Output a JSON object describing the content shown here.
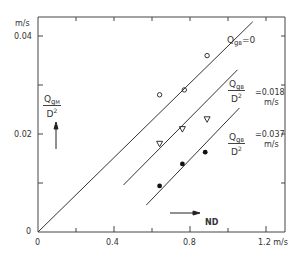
{
  "chart_data": {
    "type": "scatter",
    "title": "",
    "xlabel": "ND",
    "xunit": "m/s",
    "ylabel": "Q_gM / D^2",
    "yunit": "m/s",
    "xlim": [
      0,
      1.3
    ],
    "ylim": [
      0,
      0.044
    ],
    "x_ticks": [
      0,
      0.2,
      0.4,
      0.6,
      0.8,
      1.0,
      1.2
    ],
    "x_tick_labels": [
      "0",
      "",
      "0.4",
      "",
      "0.8",
      "",
      "1.2 m/s"
    ],
    "y_ticks": [
      0,
      0.01,
      0.02,
      0.03,
      0.04
    ],
    "y_tick_labels": [
      "0",
      "",
      "0.02",
      "",
      "0.04"
    ],
    "y_unit_label": "m/s",
    "grid": false,
    "series": [
      {
        "name": "Q_gB = 0",
        "marker": "open-circle",
        "points": [
          [
            0.64,
            0.028
          ],
          [
            0.77,
            0.029
          ],
          [
            0.89,
            0.036
          ]
        ],
        "fit_line": [
          [
            0.0,
            0.0
          ],
          [
            1.13,
            0.0429
          ]
        ]
      },
      {
        "name": "Q_gB / D^2 = 0.018 m/s",
        "marker": "open-triangle-down",
        "points": [
          [
            0.64,
            0.018
          ],
          [
            0.76,
            0.021
          ],
          [
            0.89,
            0.023
          ]
        ],
        "fit_line": [
          [
            0.45,
            0.0096
          ],
          [
            1.05,
            0.0331
          ]
        ]
      },
      {
        "name": "Q_gB / D^2 = 0.037 m/s",
        "marker": "filled-circle",
        "points": [
          [
            0.64,
            0.0094
          ],
          [
            0.76,
            0.0139
          ],
          [
            0.88,
            0.0163
          ]
        ],
        "fit_line": [
          [
            0.57,
            0.0055
          ],
          [
            1.06,
            0.0253
          ]
        ]
      }
    ],
    "annotations": [
      {
        "text": "Q_gB=0",
        "near_series": 0
      },
      {
        "text": "Q_gB/D^2 =0.018 m/s",
        "near_series": 1
      },
      {
        "text": "Q_gB/D^2 =0.037 m/s",
        "near_series": 2
      },
      {
        "text": "ND",
        "type": "x-arrow"
      },
      {
        "text": "Q_gM/D^2",
        "type": "y-arrow"
      }
    ]
  },
  "labels": {
    "y_unit": "m/s",
    "y_004": "0.04",
    "y_002": "0.02",
    "y_0": "0",
    "x_0": "0",
    "x_04": "0.4",
    "x_08": "0.8",
    "x_12": "1.2 m/s",
    "ylabel_Q": "Q",
    "ylabel_g": "g",
    "ylabel_M": "M",
    "ylabel_den": "D",
    "ylabel_exp": "2",
    "xlabel": "ND",
    "s1_Q": "Q",
    "s1_g": "g",
    "s1_B": "B",
    "s1_eq": "=0",
    "s2_Q": "Q",
    "s2_g": "g",
    "s2_B": "B",
    "s2_den": "D",
    "s2_exp": "2",
    "s2_eq": "=0.018",
    "s2_unit": "m/s",
    "s3_Q": "Q",
    "s3_g": "g",
    "s3_B": "B",
    "s3_den": "D",
    "s3_exp": "2",
    "s3_eq": "=0.037",
    "s3_unit": "m/s"
  },
  "style": {
    "line_color": "#333333",
    "text_color": "#333333",
    "background": "#ffffff"
  }
}
